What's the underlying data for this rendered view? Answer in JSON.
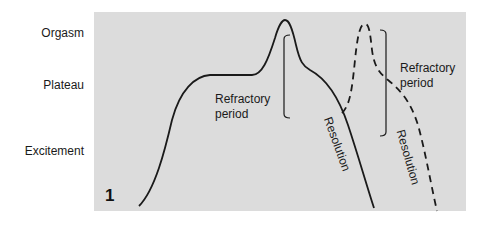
{
  "figure": {
    "number": "1",
    "background_color": "#dcdcdc",
    "line_color": "#1a1a1a"
  },
  "y_axis": {
    "labels": [
      "Orgasm",
      "Plateau",
      "Excitement"
    ]
  },
  "annotations": {
    "refractory_1": {
      "line1": "Refractory",
      "line2": "period"
    },
    "refractory_2": {
      "line1": "Refractory",
      "line2": "period"
    },
    "resolution_1": "Resolution",
    "resolution_2": "Resolution"
  },
  "curves": [
    {
      "name": "first response",
      "style": "solid",
      "phases": [
        "Excitement",
        "Plateau",
        "Orgasm",
        "Resolution"
      ]
    },
    {
      "name": "second response",
      "style": "dashed",
      "phases": [
        "Plateau",
        "Orgasm",
        "Resolution"
      ]
    }
  ]
}
